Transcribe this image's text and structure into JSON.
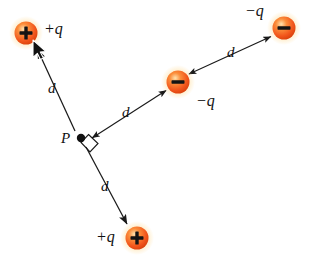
{
  "figure": {
    "background_color": "#ffffff",
    "width": 312,
    "height": 257
  },
  "style": {
    "charge_fill_core": "#ffd9a0",
    "charge_fill_mid": "#f4622a",
    "charge_fill_edge": "#e04a10",
    "charge_glow": "#ffe9b0",
    "sign_color": "#1a1a1a",
    "line_color": "#1a1a1a",
    "text_color": "#111111"
  },
  "point_p": {
    "label": "P",
    "x": 81,
    "y": 138,
    "dot_radius": 4,
    "right_angle_marker": true
  },
  "charges": [
    {
      "id": "charge-top-left",
      "sign": "+",
      "label": "+q",
      "x": 26,
      "y": 33,
      "radius": 12,
      "label_x": 44,
      "label_y": 23
    },
    {
      "id": "charge-middle",
      "sign": "−",
      "label": "−q",
      "x": 178,
      "y": 82,
      "radius": 12,
      "label_x": 182,
      "label_y": 100
    },
    {
      "id": "charge-top-right",
      "sign": "−",
      "label": "−q",
      "x": 284,
      "y": 28,
      "radius": 12,
      "label_x": 245,
      "label_y": 5
    },
    {
      "id": "charge-bottom",
      "sign": "+",
      "label": "+q",
      "x": 137,
      "y": 238,
      "radius": 12,
      "label_x": 98,
      "label_y": 228
    }
  ],
  "distance_labels": [
    {
      "id": "d-upper-left",
      "text": "d",
      "x": 50,
      "y": 80
    },
    {
      "id": "d-center-right",
      "text": "d",
      "x": 123,
      "y": 104
    },
    {
      "id": "d-upper-right",
      "text": "d",
      "x": 227,
      "y": 44
    },
    {
      "id": "d-lower",
      "text": "d",
      "x": 100,
      "y": 178
    }
  ],
  "arrows": [
    {
      "id": "arrow-p-to-topleft",
      "from": "P",
      "to": "charge-top-left",
      "x1": 75,
      "y1": 131,
      "x2": 35,
      "y2": 47,
      "head_at": "end"
    },
    {
      "id": "arrow-p-to-bottom",
      "from": "P",
      "to": "charge-bottom",
      "x1": 86,
      "y1": 147,
      "x2": 129,
      "y2": 228,
      "head_at": "end"
    },
    {
      "id": "arrow-p-to-middle",
      "from": "charge-middle",
      "to": "P",
      "x1": 168,
      "y1": 89,
      "x2": 90,
      "y2": 139,
      "head_at": "both"
    },
    {
      "id": "arrow-middle-to-topright",
      "from": "charge-middle",
      "to": "charge-top-right",
      "x1": 187,
      "y1": 74,
      "x2": 273,
      "y2": 35,
      "head_at": "both"
    }
  ],
  "cursor": {
    "name": "mouse-pointer",
    "x": 33,
    "y": 42,
    "visible": true
  }
}
